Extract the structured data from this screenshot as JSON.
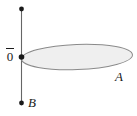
{
  "figure": {
    "kind": "geometry-diagram",
    "background_color": "#ffffff",
    "width": 137,
    "height": 116,
    "labels": {
      "origin": "0",
      "origin_has_overbar": true,
      "ellipse": "A",
      "segment_end": "B"
    },
    "colors": {
      "line": "#555555",
      "point": "#1a1a1a",
      "ellipse_stroke": "#808080",
      "ellipse_fill": "#efefef",
      "text": "#1a1a1a"
    },
    "elements": {
      "vertical_segment": {
        "name": "vertical-line",
        "x": 21.5,
        "y_top": 9,
        "y_bottom": 103
      },
      "point_top": {
        "name": "top-endpoint",
        "x": 21.5,
        "y": 9,
        "r": 2.4
      },
      "point_origin": {
        "name": "origin-point",
        "x": 21.5,
        "y": 57,
        "r": 2.6
      },
      "point_bottom": {
        "name": "bottom-endpoint",
        "x": 21.5,
        "y": 103,
        "r": 2.4
      },
      "ellipse": {
        "name": "ellipse-a",
        "cx": 77,
        "cy": 57,
        "rx": 55,
        "ry": 12.5,
        "rotation_deg": -2.5
      }
    }
  }
}
